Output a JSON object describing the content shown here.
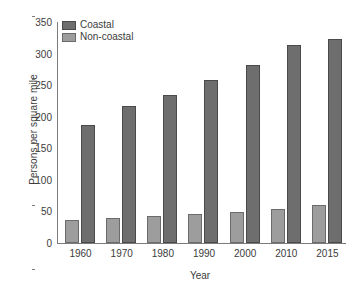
{
  "chart_data": {
    "type": "bar",
    "title": "",
    "xlabel": "Year",
    "ylabel": "Persons per square mile",
    "categories": [
      "1960",
      "1970",
      "1980",
      "1990",
      "2000",
      "2010",
      "2015"
    ],
    "series": [
      {
        "name": "Coastal",
        "color": "#6e6e6e",
        "values": [
          187,
          217,
          234,
          258,
          282,
          313,
          323
        ]
      },
      {
        "name": "Non-coastal",
        "color": "#9d9d9d",
        "values": [
          36,
          40,
          43,
          46,
          49,
          54,
          60
        ]
      }
    ],
    "ylim": [
      0,
      350
    ],
    "yticks": [
      0,
      50,
      100,
      150,
      200,
      250,
      300,
      350
    ],
    "ytick_labels": [
      "0",
      "50",
      "100",
      "150",
      "200",
      "250",
      "300",
      "350"
    ],
    "grid": false,
    "legend_position": "top-left",
    "series_draw_order": [
      "Non-coastal",
      "Coastal"
    ]
  },
  "legend": {
    "items": [
      {
        "label": "Coastal",
        "swatch": "coastal"
      },
      {
        "label": "Non-coastal",
        "swatch": "noncoastal"
      }
    ]
  }
}
